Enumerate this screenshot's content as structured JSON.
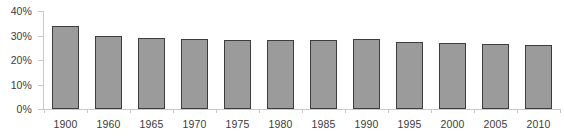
{
  "chart_data": {
    "type": "bar",
    "title": "",
    "subtitle": "",
    "xlabel": "",
    "ylabel": "",
    "categories": [
      "1900",
      "1960",
      "1965",
      "1970",
      "1975",
      "1980",
      "1985",
      "1990",
      "1995",
      "2000",
      "2005",
      "2010"
    ],
    "values": [
      34,
      30,
      29,
      28.5,
      28.2,
      28,
      28.3,
      28.5,
      27.5,
      26.8,
      26.4,
      26.2
    ],
    "ylim": [
      0,
      40
    ],
    "ytick_values": [
      0,
      10,
      20,
      30,
      40
    ],
    "ytick_labels": [
      "0%",
      "10%",
      "20%",
      "30%",
      "40%"
    ],
    "grid": false,
    "legend": null,
    "legend_position": "none",
    "value_suffix": "%",
    "colors": {
      "bar_fill": "#9b9b9b",
      "bar_border": "#3d3d3d",
      "axis_line": "#c8c8c8",
      "tick_label": "#3b3b3b",
      "background": "#ffffff"
    }
  }
}
